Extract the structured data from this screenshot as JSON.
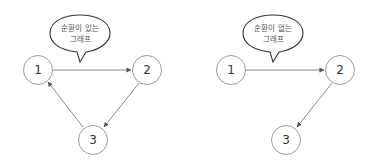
{
  "diagrams": [
    {
      "name": "cyclic-graph",
      "bubble": {
        "line1": "순환이 있는",
        "line2": "그래프"
      },
      "nodes": [
        {
          "id": "1",
          "label": "1"
        },
        {
          "id": "2",
          "label": "2"
        },
        {
          "id": "3",
          "label": "3"
        }
      ],
      "edges": [
        {
          "from": "1",
          "to": "2"
        },
        {
          "from": "2",
          "to": "3"
        },
        {
          "from": "3",
          "to": "1"
        }
      ]
    },
    {
      "name": "acyclic-graph",
      "bubble": {
        "line1": "순환이 없는",
        "line2": "그래프"
      },
      "nodes": [
        {
          "id": "1",
          "label": "1"
        },
        {
          "id": "2",
          "label": "2"
        },
        {
          "id": "3",
          "label": "3"
        }
      ],
      "edges": [
        {
          "from": "1",
          "to": "2"
        },
        {
          "from": "2",
          "to": "3"
        }
      ]
    }
  ],
  "colors": {
    "node_stroke": "#9a9a9a",
    "edge": "#8a8a8a",
    "bubble_stroke": "#333333",
    "text": "#333333"
  }
}
